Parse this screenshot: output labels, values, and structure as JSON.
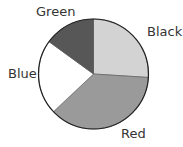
{
  "chart_data": {
    "type": "pie",
    "title": "",
    "categories": [
      "Black",
      "Red",
      "Blue",
      "Green"
    ],
    "values": [
      26,
      37,
      22,
      15
    ],
    "colors": [
      "#d3d3d3",
      "#9a9a9a",
      "#ffffff",
      "#575757"
    ],
    "start_angle_deg": 0,
    "direction": "clockwise",
    "legend": "none (direct labels)"
  },
  "labels": {
    "black": "Black",
    "red": "Red",
    "blue": "Blue",
    "green": "Green"
  }
}
